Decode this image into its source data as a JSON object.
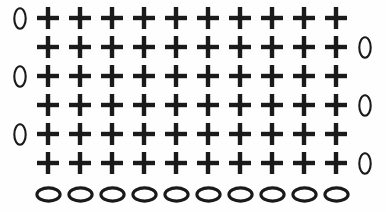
{
  "figure": {
    "title": "Plus-sign grid with oval markers",
    "background_color": "#fefefe",
    "ink_color": "#1a1a1a",
    "width": 386,
    "height": 212
  },
  "grid": {
    "columns": 10,
    "cross_rows": 6,
    "ellipse_rows": 1,
    "column_pitch": 32,
    "row_pitch": 29,
    "first_column_x": 48,
    "first_row_y": 18,
    "cross_symbol": "+",
    "oval_symbol": "0",
    "ellipse_symbol": "0"
  },
  "cross_glyph": {
    "name": "plus-icon",
    "size": 22,
    "stroke": 4.4
  },
  "vertical_oval_glyph": {
    "name": "vertical-oval-icon",
    "width": 14,
    "height": 23
  },
  "horizontal_ellipse_glyph": {
    "name": "horizontal-ellipse-icon",
    "width": 27,
    "height": 17
  },
  "rows": [
    {
      "index": 1,
      "y": 18,
      "crosses": 10,
      "left_marker": true,
      "right_marker": false,
      "left_marker_label": "0",
      "right_marker_label": ""
    },
    {
      "index": 2,
      "y": 47,
      "crosses": 10,
      "left_marker": false,
      "right_marker": true,
      "left_marker_label": "",
      "right_marker_label": "0"
    },
    {
      "index": 3,
      "y": 76,
      "crosses": 10,
      "left_marker": true,
      "right_marker": false,
      "left_marker_label": "0",
      "right_marker_label": ""
    },
    {
      "index": 4,
      "y": 105,
      "crosses": 10,
      "left_marker": false,
      "right_marker": true,
      "left_marker_label": "",
      "right_marker_label": "0"
    },
    {
      "index": 5,
      "y": 134,
      "crosses": 10,
      "left_marker": true,
      "right_marker": false,
      "left_marker_label": "0",
      "right_marker_label": ""
    },
    {
      "index": 6,
      "y": 163,
      "crosses": 10,
      "left_marker": false,
      "right_marker": true,
      "left_marker_label": "",
      "right_marker_label": "0"
    }
  ],
  "bottom_row": {
    "index": 7,
    "y": 194,
    "count": 10,
    "label": "0"
  },
  "left_marker_x": 20,
  "right_marker_x": 365,
  "counts": {
    "total_crosses": 60,
    "total_vertical_ovals": 6,
    "total_horizontal_ellipses": 10
  }
}
